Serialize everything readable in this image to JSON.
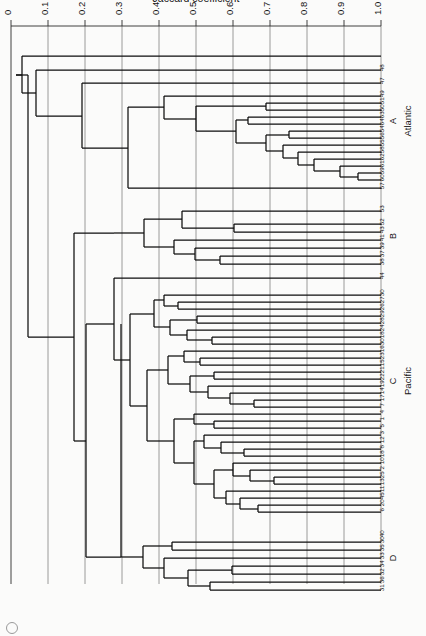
{
  "chart_data": {
    "type": "dendrogram",
    "title": "",
    "xlabel": "Jaccard coefficient",
    "ylabel": "",
    "xlim": [
      1.0,
      0.0
    ],
    "x_axis_reversed": true,
    "grid": true,
    "tick_labels": [
      "1.0",
      "0.9",
      "0.8",
      "0.7",
      "0.6",
      "0.5",
      "0.4",
      "0.3",
      "0.2",
      "0.1",
      "0"
    ],
    "tick_values": [
      1.0,
      0.9,
      0.8,
      0.7,
      0.6,
      0.5,
      0.4,
      0.3,
      0.2,
      0.1,
      0.0
    ],
    "group_labels": [
      "D",
      "C",
      "B",
      "A"
    ],
    "ocean_labels": [
      "Pacific",
      "Atlantic"
    ],
    "leaf_labels": [
      "31",
      "36",
      "32",
      "34",
      "33",
      "35",
      "30",
      "40",
      "6",
      "20",
      "45",
      "11",
      "13",
      "25",
      "2",
      "10",
      "18",
      "8",
      "12",
      "3",
      "5",
      "1",
      "4",
      "7",
      "17",
      "14",
      "19",
      "22",
      "21",
      "15",
      "23",
      "16",
      "30",
      "18",
      "24",
      "28",
      "29",
      "26",
      "27",
      "30",
      "44",
      "38",
      "37",
      "39",
      "41",
      "43",
      "52",
      "53",
      "57",
      "60",
      "59",
      "61",
      "62",
      "58",
      "55",
      "56",
      "54",
      "64",
      "63",
      "50",
      "51",
      "49",
      "47",
      "48"
    ],
    "groups": [
      {
        "id": "D",
        "ocean": "",
        "leaves": [
          "31",
          "36",
          "32",
          "34",
          "33",
          "35",
          "30",
          "40"
        ]
      },
      {
        "id": "C",
        "ocean": "Pacific",
        "leaves": [
          "6",
          "20",
          "45",
          "11",
          "13",
          "25",
          "2",
          "10",
          "18",
          "8",
          "12",
          "3",
          "5",
          "1",
          "4",
          "7",
          "17",
          "14",
          "19",
          "22",
          "21",
          "15",
          "23",
          "16",
          "30",
          "18",
          "24",
          "28",
          "29",
          "26",
          "27"
        ]
      },
      {
        "id": "B",
        "ocean": "",
        "leaves": [
          "30",
          "44",
          "38",
          "37",
          "39",
          "41",
          "43"
        ]
      },
      {
        "id": "A",
        "ocean": "Atlantic",
        "leaves": [
          "52",
          "53",
          "57",
          "60",
          "59",
          "61",
          "62",
          "58",
          "55",
          "56",
          "54",
          "64",
          "63",
          "50",
          "51",
          "49",
          "47",
          "48"
        ]
      }
    ],
    "notable_merge_heights": {
      "group_D_internal": [
        0.58,
        0.52,
        0.47,
        0.3
      ],
      "group_C_internal": [
        0.82,
        0.78,
        0.74,
        0.71,
        0.69,
        0.67,
        0.65,
        0.63,
        0.6,
        0.55,
        0.5,
        0.45,
        0.4,
        0.33
      ],
      "group_B_internal": [
        0.6,
        0.52,
        0.48,
        0.42,
        0.3
      ],
      "group_A_internal": [
        0.84,
        0.8,
        0.75,
        0.7,
        0.66,
        0.6,
        0.55,
        0.42,
        0.3,
        0.1
      ],
      "D_plus_C": 0.22,
      "DC_plus_B": 0.16,
      "root": 0.03
    }
  },
  "figure": {
    "panel_mark": "figure-circle-mark"
  }
}
